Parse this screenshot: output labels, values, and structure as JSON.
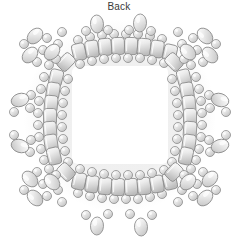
{
  "figure": {
    "caption": "Back",
    "view_label": "Back",
    "background_color": "#ffffff",
    "line_color": "#8a8a8a",
    "bead_fill_light": "#f2f2f2",
    "bead_fill_mid": "#d8d8d8",
    "bead_fill_dark": "#b5b5b5",
    "shadow_color": "#e8e8e8",
    "width": 238,
    "height": 248
  },
  "frame": {
    "opening": {
      "x": 72,
      "y": 66,
      "width": 96,
      "height": 98,
      "fill": "#ffffff"
    },
    "border_bounds": {
      "x": 34,
      "y": 30,
      "width": 172,
      "height": 172
    }
  },
  "beads": {
    "tile_count_top": 10,
    "tile_count_bottom": 10,
    "tile_count_left": 9,
    "tile_count_right": 9,
    "tile_size": {
      "width": 13,
      "height": 17
    },
    "seed_diameter": 9,
    "accent_oval": {
      "width": 13,
      "height": 18
    },
    "corner_cluster_count": 4,
    "side_protrusion_count_left": 2,
    "side_protrusion_count_right": 2,
    "top_accent_count": 2,
    "bottom_pendant_count": 2
  },
  "top_edge": {
    "tiles": [
      {
        "cx": 79,
        "cy": 52,
        "rot": -13
      },
      {
        "cx": 92,
        "cy": 49,
        "rot": -9
      },
      {
        "cx": 105,
        "cy": 47,
        "rot": -5
      },
      {
        "cx": 118,
        "cy": 46,
        "rot": -2
      },
      {
        "cx": 131,
        "cy": 46,
        "rot": 2
      },
      {
        "cx": 144,
        "cy": 47,
        "rot": 5
      },
      {
        "cx": 157,
        "cy": 49,
        "rot": 9
      },
      {
        "cx": 170,
        "cy": 53,
        "rot": 13
      }
    ],
    "inner_seeds": [
      {
        "cx": 80,
        "cy": 64
      },
      {
        "cx": 92,
        "cy": 61
      },
      {
        "cx": 104,
        "cy": 59
      },
      {
        "cx": 116,
        "cy": 58
      },
      {
        "cx": 128,
        "cy": 58
      },
      {
        "cx": 140,
        "cy": 58
      },
      {
        "cx": 152,
        "cy": 60
      },
      {
        "cx": 164,
        "cy": 63
      }
    ],
    "outer_seeds": [
      {
        "cx": 78,
        "cy": 40
      },
      {
        "cx": 90,
        "cy": 37
      },
      {
        "cx": 102,
        "cy": 35
      },
      {
        "cx": 114,
        "cy": 34
      },
      {
        "cx": 126,
        "cy": 34
      },
      {
        "cx": 138,
        "cy": 34
      },
      {
        "cx": 150,
        "cy": 36
      },
      {
        "cx": 162,
        "cy": 39
      }
    ],
    "accents": [
      {
        "cx": 97,
        "cy": 24,
        "rot": -4
      },
      {
        "cx": 140,
        "cy": 23,
        "rot": 3
      }
    ],
    "accent_side_seeds": [
      {
        "cx": 86,
        "cy": 31
      },
      {
        "cx": 108,
        "cy": 30
      },
      {
        "cx": 129,
        "cy": 30
      },
      {
        "cx": 151,
        "cy": 31
      }
    ]
  },
  "bottom_edge": {
    "tiles": [
      {
        "cx": 79,
        "cy": 181,
        "rot": 13
      },
      {
        "cx": 92,
        "cy": 184,
        "rot": 9
      },
      {
        "cx": 105,
        "cy": 186,
        "rot": 5
      },
      {
        "cx": 118,
        "cy": 187,
        "rot": 2
      },
      {
        "cx": 131,
        "cy": 187,
        "rot": -2
      },
      {
        "cx": 144,
        "cy": 186,
        "rot": -5
      },
      {
        "cx": 157,
        "cy": 184,
        "rot": -9
      },
      {
        "cx": 170,
        "cy": 181,
        "rot": -13
      }
    ],
    "inner_seeds": [
      {
        "cx": 80,
        "cy": 169
      },
      {
        "cx": 92,
        "cy": 172
      },
      {
        "cx": 104,
        "cy": 174
      },
      {
        "cx": 116,
        "cy": 175
      },
      {
        "cx": 128,
        "cy": 175
      },
      {
        "cx": 140,
        "cy": 175
      },
      {
        "cx": 152,
        "cy": 173
      },
      {
        "cx": 164,
        "cy": 170
      }
    ],
    "outer_seeds": [
      {
        "cx": 78,
        "cy": 193
      },
      {
        "cx": 90,
        "cy": 196
      },
      {
        "cx": 102,
        "cy": 198
      },
      {
        "cx": 114,
        "cy": 199
      },
      {
        "cx": 126,
        "cy": 199
      },
      {
        "cx": 138,
        "cy": 199
      },
      {
        "cx": 150,
        "cy": 197
      },
      {
        "cx": 162,
        "cy": 194
      }
    ],
    "pendants": [
      {
        "cx": 97,
        "cy": 226,
        "rot": 3
      },
      {
        "cx": 141,
        "cy": 227,
        "rot": -3
      }
    ],
    "pendant_side_seeds": [
      {
        "cx": 86,
        "cy": 215
      },
      {
        "cx": 108,
        "cy": 214
      },
      {
        "cx": 130,
        "cy": 214
      },
      {
        "cx": 152,
        "cy": 215
      }
    ]
  },
  "left_edge": {
    "tiles": [
      {
        "cx": 56,
        "cy": 78,
        "rot": 14
      },
      {
        "cx": 53,
        "cy": 91,
        "rot": 9
      },
      {
        "cx": 51,
        "cy": 104,
        "rot": 5
      },
      {
        "cx": 50,
        "cy": 117,
        "rot": 0
      },
      {
        "cx": 50,
        "cy": 130,
        "rot": -4
      },
      {
        "cx": 51,
        "cy": 143,
        "rot": -8
      },
      {
        "cx": 54,
        "cy": 156,
        "rot": -13
      }
    ],
    "inner_seeds": [
      {
        "cx": 68,
        "cy": 79
      },
      {
        "cx": 65,
        "cy": 91
      },
      {
        "cx": 63,
        "cy": 103
      },
      {
        "cx": 62,
        "cy": 115
      },
      {
        "cx": 62,
        "cy": 127
      },
      {
        "cx": 63,
        "cy": 139
      },
      {
        "cx": 65,
        "cy": 151
      },
      {
        "cx": 68,
        "cy": 162
      }
    ],
    "outer_seeds": [
      {
        "cx": 44,
        "cy": 77
      },
      {
        "cx": 41,
        "cy": 89
      },
      {
        "cx": 39,
        "cy": 101
      },
      {
        "cx": 38,
        "cy": 113
      },
      {
        "cx": 38,
        "cy": 125
      },
      {
        "cx": 39,
        "cy": 137
      },
      {
        "cx": 41,
        "cy": 149
      },
      {
        "cx": 44,
        "cy": 160
      }
    ],
    "protrusions": [
      {
        "oval": {
          "cx": 20,
          "cy": 100,
          "rot": 72
        },
        "seeds": [
          {
            "cx": 31,
            "cy": 95
          },
          {
            "cx": 30,
            "cy": 108
          },
          {
            "cx": 14,
            "cy": 112
          }
        ]
      },
      {
        "oval": {
          "cx": 20,
          "cy": 146,
          "rot": 108
        },
        "seeds": [
          {
            "cx": 31,
            "cy": 140
          },
          {
            "cx": 30,
            "cy": 152
          },
          {
            "cx": 14,
            "cy": 135
          }
        ]
      }
    ]
  },
  "right_edge": {
    "tiles": [
      {
        "cx": 184,
        "cy": 78,
        "rot": -14
      },
      {
        "cx": 187,
        "cy": 91,
        "rot": -9
      },
      {
        "cx": 189,
        "cy": 104,
        "rot": -5
      },
      {
        "cx": 190,
        "cy": 117,
        "rot": 0
      },
      {
        "cx": 190,
        "cy": 130,
        "rot": 4
      },
      {
        "cx": 189,
        "cy": 143,
        "rot": 8
      },
      {
        "cx": 186,
        "cy": 156,
        "rot": 13
      }
    ],
    "inner_seeds": [
      {
        "cx": 172,
        "cy": 79
      },
      {
        "cx": 175,
        "cy": 91
      },
      {
        "cx": 177,
        "cy": 103
      },
      {
        "cx": 178,
        "cy": 115
      },
      {
        "cx": 178,
        "cy": 127
      },
      {
        "cx": 177,
        "cy": 139
      },
      {
        "cx": 175,
        "cy": 151
      },
      {
        "cx": 172,
        "cy": 162
      }
    ],
    "outer_seeds": [
      {
        "cx": 196,
        "cy": 77
      },
      {
        "cx": 199,
        "cy": 89
      },
      {
        "cx": 201,
        "cy": 101
      },
      {
        "cx": 202,
        "cy": 113
      },
      {
        "cx": 202,
        "cy": 125
      },
      {
        "cx": 201,
        "cy": 137
      },
      {
        "cx": 199,
        "cy": 149
      },
      {
        "cx": 196,
        "cy": 160
      }
    ],
    "protrusions": [
      {
        "oval": {
          "cx": 220,
          "cy": 100,
          "rot": 108
        },
        "seeds": [
          {
            "cx": 209,
            "cy": 95
          },
          {
            "cx": 210,
            "cy": 108
          },
          {
            "cx": 226,
            "cy": 112
          }
        ]
      },
      {
        "oval": {
          "cx": 220,
          "cy": 146,
          "rot": 72
        },
        "seeds": [
          {
            "cx": 209,
            "cy": 140
          },
          {
            "cx": 210,
            "cy": 152
          },
          {
            "cx": 226,
            "cy": 135
          }
        ]
      }
    ]
  },
  "corners": {
    "top_left": {
      "tiles": [
        {
          "cx": 66,
          "cy": 62,
          "rot": 44
        }
      ],
      "ovals": [
        {
          "cx": 35,
          "cy": 36,
          "rot": 44
        },
        {
          "cx": 52,
          "cy": 52,
          "rot": 44
        },
        {
          "cx": 30,
          "cy": 55,
          "rot": 44
        }
      ],
      "seeds": [
        {
          "cx": 47,
          "cy": 38
        },
        {
          "cx": 58,
          "cy": 44
        },
        {
          "cx": 43,
          "cy": 50
        },
        {
          "cx": 56,
          "cy": 59
        },
        {
          "cx": 37,
          "cy": 62
        },
        {
          "cx": 49,
          "cy": 65
        },
        {
          "cx": 24,
          "cy": 44
        },
        {
          "cx": 62,
          "cy": 32
        }
      ]
    },
    "top_right": {
      "tiles": [
        {
          "cx": 174,
          "cy": 62,
          "rot": -44
        }
      ],
      "ovals": [
        {
          "cx": 205,
          "cy": 36,
          "rot": -44
        },
        {
          "cx": 188,
          "cy": 52,
          "rot": -44
        },
        {
          "cx": 210,
          "cy": 55,
          "rot": -44
        }
      ],
      "seeds": [
        {
          "cx": 193,
          "cy": 38
        },
        {
          "cx": 182,
          "cy": 44
        },
        {
          "cx": 197,
          "cy": 50
        },
        {
          "cx": 184,
          "cy": 59
        },
        {
          "cx": 203,
          "cy": 62
        },
        {
          "cx": 191,
          "cy": 65
        },
        {
          "cx": 216,
          "cy": 44
        },
        {
          "cx": 178,
          "cy": 32
        }
      ]
    },
    "bottom_left": {
      "tiles": [
        {
          "cx": 66,
          "cy": 172,
          "rot": -44
        }
      ],
      "ovals": [
        {
          "cx": 35,
          "cy": 198,
          "rot": -44
        },
        {
          "cx": 52,
          "cy": 182,
          "rot": -44
        },
        {
          "cx": 30,
          "cy": 179,
          "rot": -44
        }
      ],
      "seeds": [
        {
          "cx": 47,
          "cy": 196
        },
        {
          "cx": 58,
          "cy": 190
        },
        {
          "cx": 43,
          "cy": 184
        },
        {
          "cx": 56,
          "cy": 175
        },
        {
          "cx": 37,
          "cy": 172
        },
        {
          "cx": 49,
          "cy": 169
        },
        {
          "cx": 24,
          "cy": 190
        },
        {
          "cx": 62,
          "cy": 202
        }
      ]
    },
    "bottom_right": {
      "tiles": [
        {
          "cx": 174,
          "cy": 172,
          "rot": 44
        }
      ],
      "ovals": [
        {
          "cx": 205,
          "cy": 198,
          "rot": 44
        },
        {
          "cx": 188,
          "cy": 182,
          "rot": 44
        },
        {
          "cx": 210,
          "cy": 179,
          "rot": 44
        }
      ],
      "seeds": [
        {
          "cx": 193,
          "cy": 196
        },
        {
          "cx": 182,
          "cy": 190
        },
        {
          "cx": 197,
          "cy": 184
        },
        {
          "cx": 184,
          "cy": 175
        },
        {
          "cx": 203,
          "cy": 172
        },
        {
          "cx": 191,
          "cy": 169
        },
        {
          "cx": 216,
          "cy": 190
        },
        {
          "cx": 178,
          "cy": 202
        }
      ]
    }
  }
}
